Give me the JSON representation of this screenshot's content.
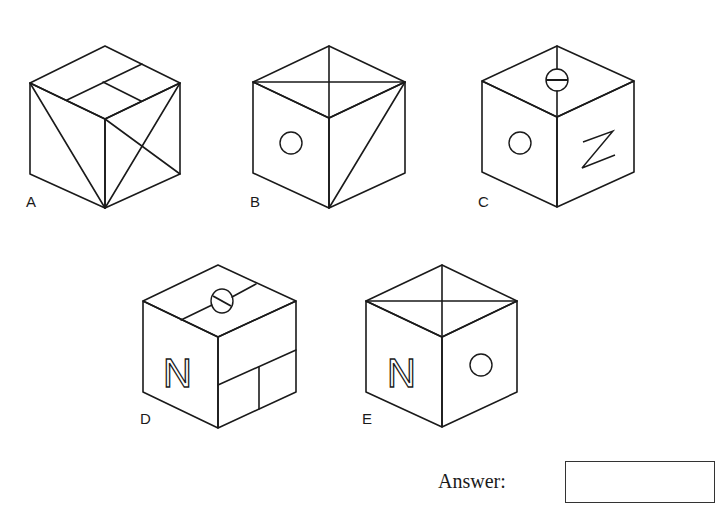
{
  "figure": {
    "cubes": [
      {
        "label": "A",
        "top_face": "rectangle divided with inner horizontal and vertical lines",
        "left_face": "diagonal from top-left to bottom",
        "right_face": "X (both diagonals)"
      },
      {
        "label": "B",
        "top_face": "X (both diagonals)",
        "left_face": "circle",
        "right_face": "diagonal from top-right to bottom"
      },
      {
        "label": "C",
        "top_face": "circle with horizontal bar on center line",
        "left_face": "circle",
        "right_face": "Z"
      },
      {
        "label": "D",
        "top_face": "line with slashed circle",
        "left_face": "N",
        "right_face": "rectangles (T-split)"
      },
      {
        "label": "E",
        "top_face": "X (both diagonals)",
        "left_face": "N",
        "right_face": "circle"
      }
    ]
  },
  "labels": {
    "A": "A",
    "B": "B",
    "C": "C",
    "D": "D",
    "E": "E",
    "N_glyph": "N"
  },
  "answer": {
    "label": "Answer:",
    "value": ""
  }
}
